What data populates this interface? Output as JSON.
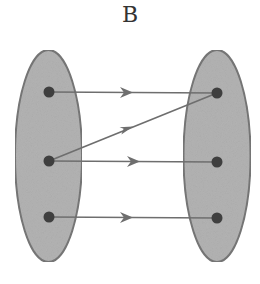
{
  "title": "B",
  "colors": {
    "set_fill": "#b3b3b3",
    "set_stroke": "#777777",
    "dot": "#3f3f3f",
    "arrow": "#6e6e6e"
  },
  "diagram": {
    "type": "function-mapping",
    "domain": {
      "label": "left set",
      "elements": 3
    },
    "codomain": {
      "label": "right set",
      "elements": 3
    },
    "mappings": [
      {
        "from": 1,
        "to": 1
      },
      {
        "from": 2,
        "to": 1
      },
      {
        "from": 2,
        "to": 2
      },
      {
        "from": 3,
        "to": 3
      }
    ]
  }
}
